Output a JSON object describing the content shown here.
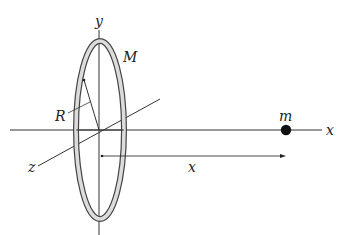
{
  "diagram": {
    "colors": {
      "line": "#333333",
      "ring_fill": "#d8d8d8",
      "ring_edge": "#444444",
      "mass": "#111111",
      "background": "#ffffff"
    },
    "labels": {
      "y_axis": "y",
      "x_axis": "x",
      "z_axis": "z",
      "ring_mass": "M",
      "radius": "R",
      "point_mass": "m",
      "distance": "x"
    },
    "geometry": {
      "origin": [
        99,
        130
      ],
      "ring_rx": 23,
      "ring_ry": 88,
      "mass_position": [
        286,
        130
      ],
      "distance_arrow": {
        "from": [
          101,
          156
        ],
        "to": [
          284,
          156
        ]
      }
    }
  }
}
